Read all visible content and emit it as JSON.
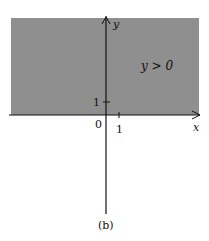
{
  "diagram": {
    "region_label": "y > 0",
    "y_axis_label": "y",
    "x_axis_label": "x",
    "origin_label": "0",
    "y_tick_label": "1",
    "x_tick_label": "1",
    "caption": "(b)",
    "shade_color": "#8f8f8f",
    "axis_color": "#111111"
  }
}
